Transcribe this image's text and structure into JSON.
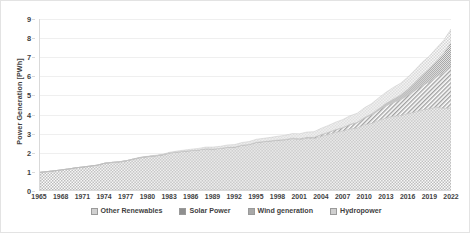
{
  "chart_data": {
    "type": "area",
    "stacked": true,
    "title": "",
    "xlabel": "",
    "ylabel": "Power Generation [PWh]",
    "ylim": [
      0,
      9
    ],
    "xlim": [
      1965,
      2022
    ],
    "grid": true,
    "legend_position": "bottom",
    "y_ticks": [
      0,
      1,
      2,
      3,
      4,
      5,
      6,
      7,
      8,
      9
    ],
    "x_ticks": [
      1965,
      1968,
      1971,
      1974,
      1977,
      1980,
      1983,
      1986,
      1989,
      1992,
      1995,
      1998,
      2001,
      2004,
      2007,
      2010,
      2013,
      2016,
      2019,
      2022
    ],
    "x": [
      1965,
      1966,
      1967,
      1968,
      1969,
      1970,
      1971,
      1972,
      1973,
      1974,
      1975,
      1976,
      1977,
      1978,
      1979,
      1980,
      1981,
      1982,
      1983,
      1984,
      1985,
      1986,
      1987,
      1988,
      1989,
      1990,
      1991,
      1992,
      1993,
      1994,
      1995,
      1996,
      1997,
      1998,
      1999,
      2000,
      2001,
      2002,
      2003,
      2004,
      2005,
      2006,
      2007,
      2008,
      2009,
      2010,
      2011,
      2012,
      2013,
      2014,
      2015,
      2016,
      2017,
      2018,
      2019,
      2020,
      2021,
      2022
    ],
    "series": [
      {
        "name": "Hydropower",
        "color": "#bfbfbf",
        "pattern": "fine-dots",
        "values": [
          0.93,
          0.97,
          1.01,
          1.06,
          1.11,
          1.17,
          1.21,
          1.26,
          1.31,
          1.41,
          1.45,
          1.48,
          1.54,
          1.63,
          1.71,
          1.76,
          1.8,
          1.85,
          1.95,
          2.0,
          2.04,
          2.08,
          2.11,
          2.17,
          2.16,
          2.19,
          2.24,
          2.25,
          2.35,
          2.39,
          2.5,
          2.54,
          2.58,
          2.61,
          2.64,
          2.7,
          2.66,
          2.72,
          2.71,
          2.83,
          2.93,
          3.04,
          3.11,
          3.22,
          3.26,
          3.45,
          3.51,
          3.67,
          3.79,
          3.89,
          3.92,
          4.02,
          4.1,
          4.22,
          4.27,
          4.37,
          4.3,
          4.33
        ]
      },
      {
        "name": "Wind generation",
        "color": "#a8a8a8",
        "pattern": "diagonal-hatch",
        "values": [
          0.0,
          0.0,
          0.0,
          0.0,
          0.0,
          0.0,
          0.0,
          0.0,
          0.0,
          0.0,
          0.0,
          0.0,
          0.0,
          0.0,
          0.0,
          0.0,
          0.0,
          0.0,
          0.0,
          0.0,
          0.0,
          0.0,
          0.0,
          0.0,
          0.0,
          0.0,
          0.01,
          0.01,
          0.01,
          0.01,
          0.01,
          0.01,
          0.01,
          0.02,
          0.02,
          0.03,
          0.04,
          0.05,
          0.06,
          0.08,
          0.1,
          0.13,
          0.17,
          0.22,
          0.28,
          0.34,
          0.44,
          0.53,
          0.64,
          0.71,
          0.83,
          0.96,
          1.13,
          1.27,
          1.42,
          1.59,
          1.86,
          2.13
        ]
      },
      {
        "name": "Solar Power",
        "color": "#8f8f8f",
        "pattern": "dense-grid",
        "values": [
          0.0,
          0.0,
          0.0,
          0.0,
          0.0,
          0.0,
          0.0,
          0.0,
          0.0,
          0.0,
          0.0,
          0.0,
          0.0,
          0.0,
          0.0,
          0.0,
          0.0,
          0.0,
          0.0,
          0.0,
          0.0,
          0.0,
          0.0,
          0.0,
          0.0,
          0.0,
          0.0,
          0.0,
          0.0,
          0.0,
          0.0,
          0.0,
          0.0,
          0.0,
          0.0,
          0.0,
          0.0,
          0.0,
          0.0,
          0.01,
          0.01,
          0.01,
          0.01,
          0.02,
          0.02,
          0.03,
          0.06,
          0.09,
          0.13,
          0.19,
          0.25,
          0.33,
          0.45,
          0.58,
          0.7,
          0.85,
          1.05,
          1.32
        ]
      },
      {
        "name": "Other Renewables",
        "color": "#d0d0d0",
        "pattern": "light-dots",
        "values": [
          0.0,
          0.0,
          0.0,
          0.0,
          0.0,
          0.0,
          0.0,
          0.0,
          0.0,
          0.0,
          0.01,
          0.01,
          0.01,
          0.01,
          0.02,
          0.02,
          0.03,
          0.03,
          0.04,
          0.05,
          0.06,
          0.07,
          0.08,
          0.09,
          0.1,
          0.11,
          0.12,
          0.13,
          0.14,
          0.15,
          0.16,
          0.17,
          0.18,
          0.2,
          0.22,
          0.24,
          0.26,
          0.28,
          0.3,
          0.33,
          0.36,
          0.39,
          0.42,
          0.45,
          0.48,
          0.51,
          0.54,
          0.57,
          0.59,
          0.61,
          0.62,
          0.63,
          0.64,
          0.65,
          0.66,
          0.67,
          0.68,
          0.69
        ]
      }
    ],
    "totals_note": "",
    "peak_total": 8.47
  },
  "axes": {
    "y_title": "Power Generation [PWh]"
  },
  "legend": {
    "items": [
      {
        "label": "Other Renewables",
        "color": "#d0d0d0"
      },
      {
        "label": "Solar Power",
        "color": "#8f8f8f"
      },
      {
        "label": "Wind generation",
        "color": "#a8a8a8"
      },
      {
        "label": "Hydropower",
        "color": "#cfcfcf"
      }
    ]
  }
}
